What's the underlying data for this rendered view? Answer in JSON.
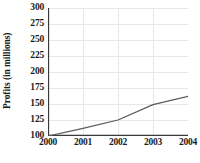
{
  "chart_data": {
    "type": "line",
    "title": "",
    "subtitle": "",
    "xlabel": "",
    "ylabel": "Profits (in millions)",
    "x": [
      2000,
      2001,
      2002,
      2003,
      2004
    ],
    "categories": [
      "2000",
      "2001",
      "2002",
      "2003",
      "2004"
    ],
    "values": [
      100,
      112,
      125,
      149,
      162
    ],
    "series": [
      {
        "name": "Profits",
        "values": [
          100,
          112,
          125,
          149,
          162
        ]
      }
    ],
    "xlim": [
      2000,
      2004
    ],
    "ylim": [
      100,
      300
    ],
    "ytick_labels": [
      "300",
      "275",
      "250",
      "225",
      "200",
      "175",
      "150",
      "125",
      "100"
    ],
    "ytick_values": [
      300,
      275,
      250,
      225,
      200,
      175,
      150,
      125,
      100
    ],
    "xtick_labels": [
      "2000",
      "2001",
      "2002",
      "2003",
      "2004"
    ],
    "xtick_values": [
      2000,
      2001,
      2002,
      2003,
      2004
    ],
    "grid": true,
    "grid_axis": "both",
    "legend": false,
    "legend_position": "none",
    "annotations": [],
    "colors": {
      "line": "#595959",
      "grid": "#e8e8e8",
      "axis": "#3a3a3a",
      "background": "#ffffff",
      "text": "#1a1a1a"
    }
  },
  "caption": {
    "text": ""
  }
}
